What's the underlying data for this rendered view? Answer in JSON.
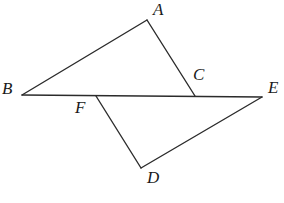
{
  "figure": {
    "canvas": {
      "width": 284,
      "height": 203
    },
    "background_color": "#ffffff",
    "stroke_color": "#2b2b2b",
    "label_color": "#1a1a1a",
    "stroke_width": 1.4,
    "points": [
      {
        "id": "A",
        "label": "A",
        "x": 147,
        "y": 20,
        "label_x": 153,
        "label_y": 1
      },
      {
        "id": "B",
        "label": "B",
        "x": 22,
        "y": 95,
        "label_x": 2,
        "label_y": 80
      },
      {
        "id": "C",
        "label": "C",
        "x": 195,
        "y": 96,
        "label_x": 193,
        "label_y": 66
      },
      {
        "id": "D",
        "label": "D",
        "x": 141,
        "y": 168,
        "label_x": 147,
        "label_y": 169
      },
      {
        "id": "E",
        "label": "E",
        "x": 262,
        "y": 97,
        "label_x": 268,
        "label_y": 79
      },
      {
        "id": "F",
        "label": "F",
        "x": 96,
        "y": 96,
        "label_x": 75,
        "label_y": 99
      }
    ],
    "segments": [
      {
        "id": "BA",
        "from": "B",
        "to": "A",
        "x1": 22,
        "y1": 95,
        "x2": 147,
        "y2": 20
      },
      {
        "id": "AC",
        "from": "A",
        "to": "C",
        "x1": 147,
        "y1": 20,
        "x2": 195,
        "y2": 96
      },
      {
        "id": "BE",
        "from": "B",
        "to": "E",
        "x1": 22,
        "y1": 95,
        "x2": 262,
        "y2": 97
      },
      {
        "id": "FD",
        "from": "F",
        "to": "D",
        "x1": 96,
        "y1": 96,
        "x2": 141,
        "y2": 168
      },
      {
        "id": "DE",
        "from": "D",
        "to": "E",
        "x1": 141,
        "y1": 168,
        "x2": 262,
        "y2": 97
      }
    ]
  }
}
